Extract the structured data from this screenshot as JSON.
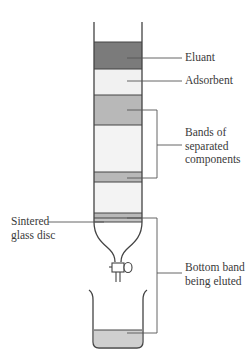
{
  "labels": {
    "eluant": "Eluant",
    "adsorbent": "Adsorbent",
    "bands_line1": "Bands of",
    "bands_line2": "separated",
    "bands_line3": "components",
    "disc_line1": "Sintered",
    "disc_line2": "glass disc",
    "bottom_line1": "Bottom band",
    "bottom_line2": "being eluted"
  },
  "colors": {
    "eluant": "#7b7b7b",
    "adsorbent": "#f1f1f1",
    "band": "#b8b8b8",
    "outline": "#444444",
    "leader": "#555555",
    "liquid": "#cfcfcf"
  }
}
